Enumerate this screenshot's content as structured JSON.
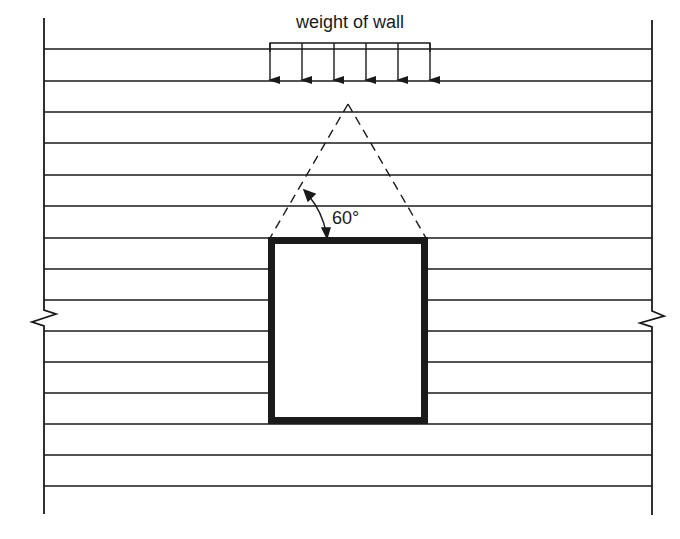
{
  "diagram": {
    "load_label": "weight of wall",
    "angle_label": "60°",
    "colors": {
      "stroke": "#1a1a1a",
      "background": "#ffffff"
    },
    "wall": {
      "left_x": 44,
      "right_x": 652,
      "top_y": 18,
      "bottom_y": 514,
      "course_lines_y": [
        49,
        81,
        112,
        143,
        175,
        206,
        238,
        269,
        300,
        331,
        362,
        393,
        424,
        455,
        486
      ],
      "break_symbol": "zigzag",
      "break_y": [
        300,
        331
      ]
    },
    "opening": {
      "x": 268,
      "y": 237,
      "width": 160,
      "height": 187,
      "stroke_width": 7
    },
    "load_arrows": {
      "count": 6,
      "x": [
        270,
        302,
        334,
        366,
        398,
        430
      ],
      "bracket_y": 43,
      "tip_y": 91
    },
    "load_triangle": {
      "apex": [
        348,
        104
      ],
      "base_left": [
        270,
        238
      ],
      "base_right": [
        426,
        238
      ],
      "style": "dashed",
      "angle_deg": 60
    }
  }
}
